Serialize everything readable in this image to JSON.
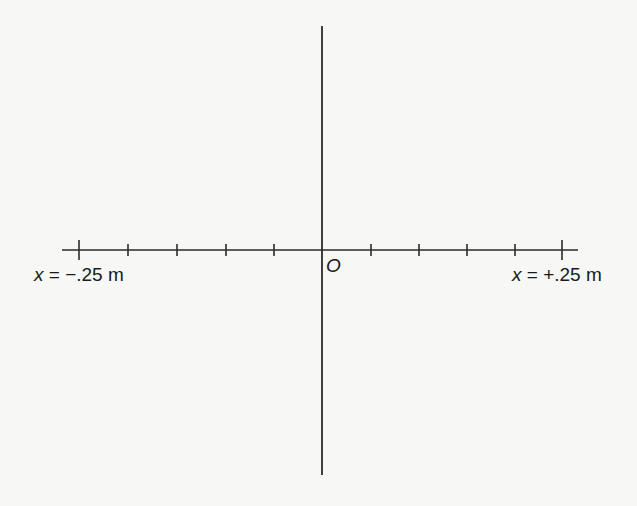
{
  "diagram": {
    "type": "coordinate-axes",
    "origin_label": "O",
    "left_endpoint": {
      "var": "x",
      "eq": " = ",
      "value": "−.25 m",
      "text": "x = −.25 m"
    },
    "right_endpoint": {
      "var": "x",
      "eq": " = ",
      "value": "+.25 m",
      "text": "x = +.25 m"
    },
    "x_axis": {
      "y": 250,
      "x_start": 62,
      "x_end": 578
    },
    "y_axis": {
      "x": 322,
      "y_start": 26,
      "y_end": 475
    },
    "major_ticks_x": [
      79,
      562
    ],
    "minor_ticks_x": [
      128,
      177,
      226,
      274,
      371,
      419,
      467,
      515
    ],
    "tick_count_each_side": 5,
    "line_color": "#2b2b2b"
  }
}
